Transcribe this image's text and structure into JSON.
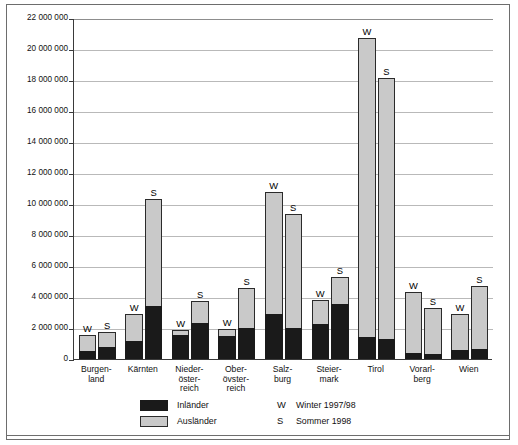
{
  "chart_data": {
    "type": "bar",
    "title": "",
    "subtitle": "",
    "xlabel": "",
    "ylabel": "",
    "ylim": [
      0,
      22000000
    ],
    "ytick_step": 2000000,
    "grid": true,
    "stacked": true,
    "legend_position": "bottom",
    "ytick_labels": [
      "22 000 000",
      "20 000 000",
      "18 000 000",
      "16 000 000",
      "14 000 000",
      "12 000 000",
      "10 000 000",
      "8 000 000",
      "6 000 000",
      "4 000 000",
      "2 000 000",
      "0"
    ],
    "ytick_values": [
      22000000,
      20000000,
      18000000,
      16000000,
      14000000,
      12000000,
      10000000,
      8000000,
      6000000,
      4000000,
      2000000,
      0
    ],
    "categories": [
      "Burgen-\nland",
      "Kärnten",
      "Nieder-\nöster-\nreich",
      "Ober-\növster-\nreich",
      "Salz-\nburg",
      "Steier-\nmark",
      "Tirol",
      "Vorarl-\nberg",
      "Wien"
    ],
    "category_names": [
      "Burgenland",
      "Kärnten",
      "Niederösterreich",
      "Oberösterreich",
      "Salzburg",
      "Steiermark",
      "Tirol",
      "Vorarlberg",
      "Wien"
    ],
    "series": [
      {
        "name": "Inländer",
        "color": "#1a1a1a",
        "values_winter": [
          500000,
          1150000,
          1550000,
          1500000,
          2900000,
          2250000,
          1400000,
          400000,
          550000
        ],
        "values_summer": [
          800000,
          3450000,
          2300000,
          2000000,
          2000000,
          3550000,
          1300000,
          300000,
          650000
        ]
      },
      {
        "name": "Ausländer",
        "color": "#c9c9c9",
        "values_winter": [
          1050000,
          1750000,
          300000,
          450000,
          7900000,
          1550000,
          19300000,
          3900000,
          2350000
        ],
        "values_summer": [
          950000,
          6850000,
          1450000,
          2600000,
          7350000,
          1750000,
          16800000,
          3000000,
          4050000
        ]
      }
    ],
    "groups": [
      {
        "category": "Burgenland",
        "bars": [
          {
            "letter": "W",
            "label": "Winter 1997/98",
            "total": 1550000,
            "domestic": 500000,
            "foreign": 1050000
          },
          {
            "letter": "S",
            "label": "Sommer 1998",
            "total": 1750000,
            "domestic": 800000,
            "foreign": 950000
          }
        ]
      },
      {
        "category": "Kärnten",
        "bars": [
          {
            "letter": "W",
            "label": "Winter 1997/98",
            "total": 2900000,
            "domestic": 1150000,
            "foreign": 1750000
          },
          {
            "letter": "S",
            "label": "Sommer 1998",
            "total": 10300000,
            "domestic": 3450000,
            "foreign": 6850000
          }
        ]
      },
      {
        "category": "Niederösterreich",
        "bars": [
          {
            "letter": "W",
            "label": "Winter 1997/98",
            "total": 1850000,
            "domestic": 1550000,
            "foreign": 300000
          },
          {
            "letter": "S",
            "label": "Sommer 1998",
            "total": 3750000,
            "domestic": 2300000,
            "foreign": 1450000
          }
        ]
      },
      {
        "category": "Oberösterreich",
        "bars": [
          {
            "letter": "W",
            "label": "Winter 1997/98",
            "total": 1950000,
            "domestic": 1500000,
            "foreign": 450000
          },
          {
            "letter": "S",
            "label": "Sommer 1998",
            "total": 4600000,
            "domestic": 2000000,
            "foreign": 2600000
          }
        ]
      },
      {
        "category": "Salzburg",
        "bars": [
          {
            "letter": "W",
            "label": "Winter 1997/98",
            "total": 10800000,
            "domestic": 2900000,
            "foreign": 7900000
          },
          {
            "letter": "S",
            "label": "Sommer 1998",
            "total": 9350000,
            "domestic": 2000000,
            "foreign": 7350000
          }
        ]
      },
      {
        "category": "Steiermark",
        "bars": [
          {
            "letter": "W",
            "label": "Winter 1997/98",
            "total": 3800000,
            "domestic": 2250000,
            "foreign": 1550000
          },
          {
            "letter": "S",
            "label": "Sommer 1998",
            "total": 5300000,
            "domestic": 3550000,
            "foreign": 1750000
          }
        ]
      },
      {
        "category": "Tirol",
        "bars": [
          {
            "letter": "W",
            "label": "Winter 1997/98",
            "total": 20700000,
            "domestic": 1400000,
            "foreign": 19300000
          },
          {
            "letter": "S",
            "label": "Sommer 1998",
            "total": 18100000,
            "domestic": 1300000,
            "foreign": 16800000
          }
        ]
      },
      {
        "category": "Vorarlberg",
        "bars": [
          {
            "letter": "W",
            "label": "Winter 1997/98",
            "total": 4300000,
            "domestic": 400000,
            "foreign": 3900000
          },
          {
            "letter": "S",
            "label": "Sommer 1998",
            "total": 3300000,
            "domestic": 300000,
            "foreign": 3000000
          }
        ]
      },
      {
        "category": "Wien",
        "bars": [
          {
            "letter": "W",
            "label": "Winter 1997/98",
            "total": 2900000,
            "domestic": 550000,
            "foreign": 2350000
          },
          {
            "letter": "S",
            "label": "Sommer 1998",
            "total": 4700000,
            "domestic": 650000,
            "foreign": 4050000
          }
        ]
      }
    ]
  },
  "legend": {
    "items": [
      {
        "swatch": "black",
        "label": "Inländer"
      },
      {
        "swatch": "grey",
        "label": "Ausländer"
      }
    ],
    "markers": [
      {
        "letter": "W",
        "label": "Winter 1997/98"
      },
      {
        "letter": "S",
        "label": "Sommer 1998"
      }
    ]
  }
}
